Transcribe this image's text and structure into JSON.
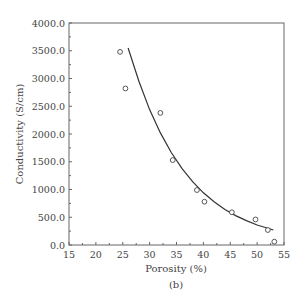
{
  "chart_data": {
    "type": "scatter",
    "title": "",
    "xlabel": "Porosity (%)",
    "ylabel": "Conductivity (S/cm)",
    "caption": "(b)",
    "xlim": [
      15,
      55
    ],
    "ylim": [
      0,
      4000
    ],
    "xticks": [
      15,
      20,
      25,
      30,
      35,
      40,
      45,
      50,
      55
    ],
    "yticks": [
      "0.0",
      "500.0",
      "1000.0",
      "1500.0",
      "2000.0",
      "2500.0",
      "3000.0",
      "3500.0",
      "4000.0"
    ],
    "grid": false,
    "legend": null,
    "series": [
      {
        "name": "Measured",
        "marker": "open-circle",
        "x": [
          24.5,
          25.5,
          32.0,
          34.3,
          38.8,
          40.2,
          45.3,
          49.7,
          52.0,
          53.2
        ],
        "y": [
          3480,
          2820,
          2380,
          1530,
          990,
          780,
          590,
          460,
          270,
          60
        ]
      },
      {
        "name": "Fit",
        "style": "line",
        "x": [
          26.0,
          28.0,
          30.0,
          32.0,
          34.0,
          36.0,
          38.0,
          40.0,
          42.0,
          44.0,
          46.0,
          48.0,
          50.0,
          52.0,
          53.0
        ],
        "y": [
          3550,
          2950,
          2440,
          2020,
          1670,
          1380,
          1140,
          940,
          780,
          640,
          530,
          440,
          360,
          300,
          270
        ]
      }
    ]
  }
}
